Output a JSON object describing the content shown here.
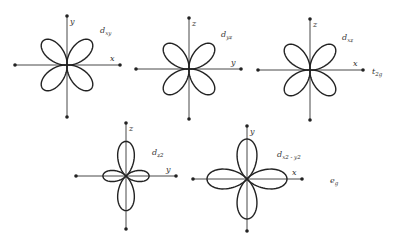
{
  "orbitals": [
    {
      "id": "dxy",
      "name": "d",
      "subscript": "xy",
      "h_axis": "x",
      "v_axis": "y",
      "shape": "diagonal"
    },
    {
      "id": "dyz",
      "name": "d",
      "subscript": "yz",
      "h_axis": "y",
      "v_axis": "z",
      "shape": "diagonal"
    },
    {
      "id": "dxz",
      "name": "d",
      "subscript": "xz",
      "h_axis": "x",
      "v_axis": "z",
      "shape": "diagonal"
    },
    {
      "id": "dz2",
      "name": "d",
      "subscript": "z2",
      "h_axis": "y",
      "v_axis": "z",
      "shape": "dz2"
    },
    {
      "id": "dx2y2",
      "name": "d",
      "subscript": "x2 - y2",
      "h_axis": "x",
      "v_axis": "y",
      "shape": "axial"
    }
  ],
  "groups": [
    {
      "id": "t2g",
      "name": "t",
      "subscript": "2g"
    },
    {
      "id": "eg",
      "name": "e",
      "subscript": "g"
    }
  ],
  "colors": {
    "line": "#222222",
    "background": "#ffffff"
  }
}
